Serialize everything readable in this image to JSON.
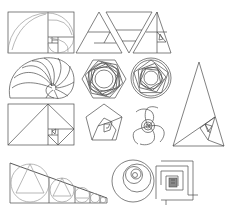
{
  "colors": {
    "background": "#ffffff",
    "stroke": "#4a4a4a",
    "light_stroke": "#9a9a9a",
    "fill_dark": "#8a8a8a"
  },
  "figures": [
    {
      "id": "golden-rectangle-arcs",
      "label": "Golden rectangle with quarter-circle arcs"
    },
    {
      "id": "golden-triangles-row",
      "label": "Row of nested golden triangles"
    },
    {
      "id": "nautilus-spiral",
      "label": "Nautilus shell spiral"
    },
    {
      "id": "rotated-hexagons",
      "label": "Rotated nested hexagons rosette"
    },
    {
      "id": "rotated-pentagons",
      "label": "Rotated nested pentagons in circle"
    },
    {
      "id": "golden-triangle-spiral",
      "label": "Tall golden triangle with nested triangles"
    },
    {
      "id": "golden-rectangle-diagonals",
      "label": "Golden rectangle subdivided with diagonals"
    },
    {
      "id": "pentagon-spiral",
      "label": "Nested pentagon spiral"
    },
    {
      "id": "swirl-spiral",
      "label": "Multi-arm swirl spiral"
    },
    {
      "id": "circles-in-triangle",
      "label": "Decreasing circles inscribed along a slope"
    },
    {
      "id": "circle-spiral",
      "label": "Nested circle spiral"
    },
    {
      "id": "square-spiral",
      "label": "Square angular spiral"
    }
  ]
}
